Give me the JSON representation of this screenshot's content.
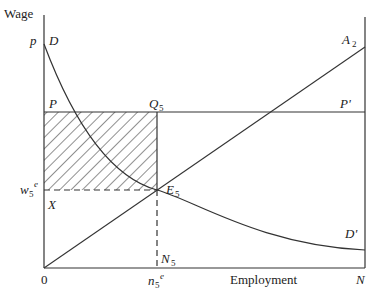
{
  "diagram": {
    "axes": {
      "y_label": "Wage",
      "x_label": "Employment",
      "origin_label": "0",
      "x_end_label": "N"
    },
    "labels": {
      "p": "p",
      "D": "D",
      "D_prime": "D'",
      "P": "P",
      "P_prime": "P'",
      "Q": "Q",
      "Q_sub": "5",
      "A": "A",
      "A_sub": "2",
      "E": "E",
      "E_sub": "5",
      "w": "w",
      "w_sub": "5",
      "w_sup": "e",
      "X": "X",
      "N_label": "N",
      "N_sub": "5",
      "n": "n",
      "n_sub": "5",
      "n_sup": "e"
    },
    "curves": [
      {
        "name": "demand",
        "from": "D",
        "to": "D'",
        "shape": "convex decreasing"
      },
      {
        "name": "supply",
        "from": "0",
        "to": "A2",
        "shape": "linear increasing"
      },
      {
        "name": "wage-line",
        "from": "P",
        "to": "P'",
        "shape": "horizontal"
      }
    ],
    "hatched_region": "P-Q5-E5-X rectangle",
    "colors": {
      "line": "#333333",
      "background": "#ffffff"
    }
  }
}
